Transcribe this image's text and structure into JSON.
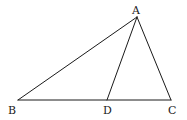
{
  "figure": {
    "points": {
      "A": {
        "x": 137,
        "y": 17,
        "label": "A",
        "lx": 132,
        "ly": 14
      },
      "B": {
        "x": 18,
        "y": 100,
        "label": "B",
        "lx": 8,
        "ly": 114
      },
      "C": {
        "x": 171,
        "y": 100,
        "label": "C",
        "lx": 168,
        "ly": 114
      },
      "D": {
        "x": 107,
        "y": 100,
        "label": "D",
        "lx": 103,
        "ly": 114
      }
    },
    "segments": [
      {
        "name": "segment-ab",
        "from": "A",
        "to": "B"
      },
      {
        "name": "segment-ac",
        "from": "A",
        "to": "C"
      },
      {
        "name": "segment-ad",
        "from": "A",
        "to": "D"
      },
      {
        "name": "segment-bc",
        "from": "B",
        "to": "C"
      }
    ],
    "stroke_color": "#1a1a1a"
  }
}
